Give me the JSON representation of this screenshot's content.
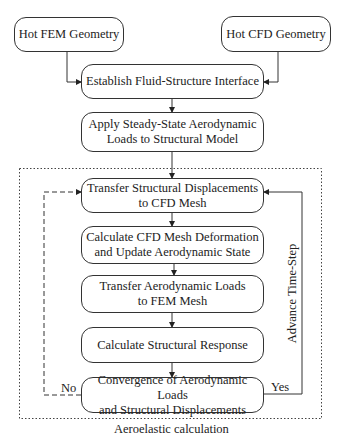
{
  "diagram": {
    "nodes": [
      {
        "id": "hot_fem",
        "label": "Hot FEM Geometry"
      },
      {
        "id": "hot_cfd",
        "label": "Hot CFD Geometry"
      },
      {
        "id": "establish",
        "label": "Establish Fluid-Structure Interface"
      },
      {
        "id": "apply",
        "label": "Apply Steady-State Aerodynamic Loads to Structural Model"
      },
      {
        "id": "transfer_disp",
        "label": "Transfer Structural Displacements to CFD Mesh"
      },
      {
        "id": "calc_cfd",
        "label": "Calculate CFD Mesh Deformation and Update Aerodynamic State"
      },
      {
        "id": "transfer_loads",
        "label": "Transfer Aerodynamic Loads to FEM Mesh"
      },
      {
        "id": "calc_struct",
        "label": "Calculate Structural Response"
      },
      {
        "id": "convergence",
        "label": "Convergence of Aerodynamic Loads and Structural Displacements"
      }
    ],
    "edges": [
      {
        "from": "hot_fem",
        "to": "establish"
      },
      {
        "from": "hot_cfd",
        "to": "establish"
      },
      {
        "from": "establish",
        "to": "apply"
      },
      {
        "from": "apply",
        "to": "transfer_disp"
      },
      {
        "from": "transfer_disp",
        "to": "calc_cfd"
      },
      {
        "from": "calc_cfd",
        "to": "transfer_loads"
      },
      {
        "from": "transfer_loads",
        "to": "calc_struct"
      },
      {
        "from": "calc_struct",
        "to": "convergence"
      },
      {
        "from": "convergence",
        "to": "transfer_disp",
        "label": "No",
        "style": "dashed"
      },
      {
        "from": "convergence",
        "to": "transfer_disp",
        "label": "Yes",
        "style": "solid",
        "path_label": "Advance Time-Step"
      }
    ],
    "group": {
      "label": "Aeroelastic calculation",
      "style": "dotted"
    }
  },
  "boxes": {
    "hot_fem_l1": "Hot FEM Geometry",
    "hot_cfd_l1": "Hot CFD Geometry",
    "establish_l1": "Establish Fluid-Structure Interface",
    "apply_l1": "Apply Steady-State Aerodynamic",
    "apply_l2": "Loads to Structural Model",
    "transfer_disp_l1": "Transfer Structural Displacements",
    "transfer_disp_l2": "to CFD Mesh",
    "calc_cfd_l1": "Calculate CFD Mesh Deformation",
    "calc_cfd_l2": "and Update Aerodynamic State",
    "transfer_loads_l1": "Transfer Aerodynamic Loads",
    "transfer_loads_l2": "to FEM Mesh",
    "calc_struct_l1": "Calculate Structural Response",
    "convergence_l1": "Convergence of Aerodynamic Loads",
    "convergence_l2": "and Structural Displacements"
  },
  "labels": {
    "no": "No",
    "yes": "Yes",
    "advance": "Advance Time-Step",
    "group": "Aeroelastic calculation"
  }
}
